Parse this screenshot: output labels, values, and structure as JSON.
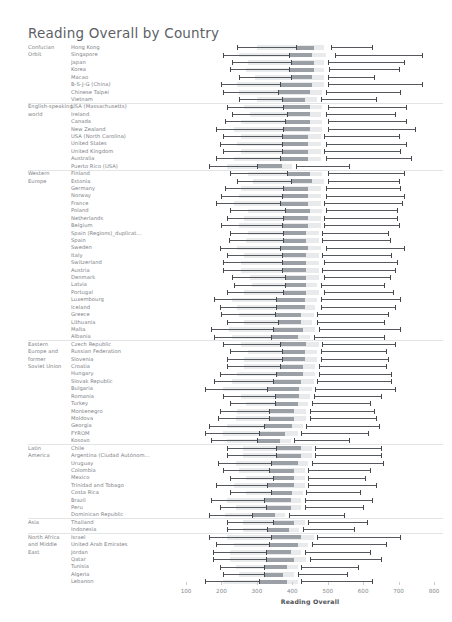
{
  "title": "Reading Overall by Country",
  "axis": {
    "label": "Reading Overall",
    "ticks": [
      100,
      200,
      300,
      400,
      500,
      600,
      700,
      800
    ],
    "min": 60,
    "max": 830
  },
  "chart_data": {
    "type": "bar",
    "title": "Reading Overall by Country",
    "xlabel": "Reading Overall",
    "ylabel": "",
    "xlim": [
      60,
      830
    ],
    "ticks": [
      100,
      200,
      300,
      400,
      500,
      600,
      700,
      800
    ],
    "grid": false,
    "legend": "none",
    "encoding": "Each row is a horizontal range (whisker low to high) with a light band and a darker central block marking the middle score range.",
    "groups": [
      {
        "group": "Confucian Orbit",
        "rows": [
          {
            "label": "Hong Kong",
            "low": 245,
            "band_start": 300,
            "dark_start": 410,
            "dark_end": 460,
            "band_end": 490,
            "mid": 510,
            "high": 625
          },
          {
            "label": "Singapore",
            "low": 205,
            "band_start": 250,
            "dark_start": 390,
            "dark_end": 455,
            "band_end": 495,
            "mid": 520,
            "high": 765
          },
          {
            "label": "Japan",
            "low": 230,
            "band_start": 275,
            "dark_start": 395,
            "dark_end": 460,
            "band_end": 490,
            "mid": 500,
            "high": 715
          },
          {
            "label": "Korea",
            "low": 225,
            "band_start": 270,
            "dark_start": 390,
            "dark_end": 460,
            "band_end": 490,
            "mid": 505,
            "high": 700
          },
          {
            "label": "Macao",
            "low": 250,
            "band_start": 295,
            "dark_start": 395,
            "dark_end": 455,
            "band_end": 490,
            "mid": 500,
            "high": 630
          },
          {
            "label": "B-S-J-G (China)",
            "low": 200,
            "band_start": 245,
            "dark_start": 365,
            "dark_end": 455,
            "band_end": 490,
            "mid": 500,
            "high": 765
          },
          {
            "label": "Chinese Taipei",
            "low": 205,
            "band_start": 250,
            "dark_start": 360,
            "dark_end": 450,
            "band_end": 485,
            "mid": 495,
            "high": 705
          },
          {
            "label": "Vietnam",
            "low": 250,
            "band_start": 300,
            "dark_start": 370,
            "dark_end": 435,
            "band_end": 470,
            "mid": 480,
            "high": 635
          }
        ]
      },
      {
        "group": "English-speaking world",
        "rows": [
          {
            "label": "USA (Massachusetts)",
            "low": 215,
            "band_start": 265,
            "dark_start": 375,
            "dark_end": 450,
            "band_end": 485,
            "mid": 500,
            "high": 720
          },
          {
            "label": "Ireland",
            "low": 230,
            "band_start": 280,
            "dark_start": 385,
            "dark_end": 450,
            "band_end": 480,
            "mid": 495,
            "high": 690
          },
          {
            "label": "Canada",
            "low": 210,
            "band_start": 255,
            "dark_start": 380,
            "dark_end": 450,
            "band_end": 485,
            "mid": 500,
            "high": 720
          },
          {
            "label": "New Zealand",
            "low": 185,
            "band_start": 235,
            "dark_start": 375,
            "dark_end": 450,
            "band_end": 485,
            "mid": 500,
            "high": 745
          },
          {
            "label": "USA (North Carolina)",
            "low": 205,
            "band_start": 255,
            "dark_start": 370,
            "dark_end": 445,
            "band_end": 480,
            "mid": 490,
            "high": 700
          },
          {
            "label": "United States",
            "low": 195,
            "band_start": 245,
            "dark_start": 370,
            "dark_end": 445,
            "band_end": 480,
            "mid": 495,
            "high": 720
          },
          {
            "label": "United Kingdom",
            "low": 205,
            "band_start": 255,
            "dark_start": 370,
            "dark_end": 445,
            "band_end": 480,
            "mid": 490,
            "high": 705
          },
          {
            "label": "Australia",
            "low": 185,
            "band_start": 235,
            "dark_start": 365,
            "dark_end": 445,
            "band_end": 480,
            "mid": 495,
            "high": 735
          },
          {
            "label": "Puerto Rico (USA)",
            "low": 165,
            "band_start": 215,
            "dark_start": 300,
            "dark_end": 370,
            "band_end": 400,
            "mid": 410,
            "high": 560
          }
        ]
      },
      {
        "group": "Western Europe",
        "rows": [
          {
            "label": "Finland",
            "low": 225,
            "band_start": 275,
            "dark_start": 385,
            "dark_end": 450,
            "band_end": 485,
            "mid": 500,
            "high": 715
          },
          {
            "label": "Estonia",
            "low": 245,
            "band_start": 290,
            "dark_start": 395,
            "dark_end": 455,
            "band_end": 490,
            "mid": 500,
            "high": 700
          },
          {
            "label": "Germany",
            "low": 210,
            "band_start": 255,
            "dark_start": 375,
            "dark_end": 445,
            "band_end": 480,
            "mid": 495,
            "high": 705
          },
          {
            "label": "Norway",
            "low": 200,
            "band_start": 250,
            "dark_start": 370,
            "dark_end": 445,
            "band_end": 480,
            "mid": 495,
            "high": 715
          },
          {
            "label": "France",
            "low": 185,
            "band_start": 235,
            "dark_start": 365,
            "dark_end": 445,
            "band_end": 480,
            "mid": 490,
            "high": 710
          },
          {
            "label": "Poland",
            "low": 225,
            "band_start": 275,
            "dark_start": 380,
            "dark_end": 450,
            "band_end": 485,
            "mid": 495,
            "high": 695
          },
          {
            "label": "Netherlands",
            "low": 215,
            "band_start": 265,
            "dark_start": 375,
            "dark_end": 445,
            "band_end": 480,
            "mid": 490,
            "high": 695
          },
          {
            "label": "Belgium",
            "low": 200,
            "band_start": 250,
            "dark_start": 370,
            "dark_end": 445,
            "band_end": 480,
            "mid": 490,
            "high": 700
          },
          {
            "label": "Spain (Regions)_duplicat...",
            "low": 225,
            "band_start": 275,
            "dark_start": 375,
            "dark_end": 440,
            "band_end": 475,
            "mid": 485,
            "high": 670
          },
          {
            "label": "Spain",
            "low": 220,
            "band_start": 270,
            "dark_start": 375,
            "dark_end": 440,
            "band_end": 475,
            "mid": 485,
            "high": 675
          },
          {
            "label": "Sweden",
            "low": 195,
            "band_start": 245,
            "dark_start": 365,
            "dark_end": 445,
            "band_end": 480,
            "mid": 495,
            "high": 715
          },
          {
            "label": "Italy",
            "low": 215,
            "band_start": 265,
            "dark_start": 370,
            "dark_end": 440,
            "band_end": 475,
            "mid": 485,
            "high": 680
          },
          {
            "label": "Switzerland",
            "low": 205,
            "band_start": 255,
            "dark_start": 370,
            "dark_end": 440,
            "band_end": 475,
            "mid": 490,
            "high": 695
          },
          {
            "label": "Austria",
            "low": 205,
            "band_start": 255,
            "dark_start": 370,
            "dark_end": 440,
            "band_end": 475,
            "mid": 485,
            "high": 690
          },
          {
            "label": "Denmark",
            "low": 230,
            "band_start": 280,
            "dark_start": 380,
            "dark_end": 440,
            "band_end": 475,
            "mid": 490,
            "high": 675
          },
          {
            "label": "Latvia",
            "low": 235,
            "band_start": 285,
            "dark_start": 380,
            "dark_end": 440,
            "band_end": 470,
            "mid": 480,
            "high": 660
          },
          {
            "label": "Portugal",
            "low": 215,
            "band_start": 265,
            "dark_start": 375,
            "dark_end": 440,
            "band_end": 475,
            "mid": 490,
            "high": 685
          },
          {
            "label": "Luxembourg",
            "low": 180,
            "band_start": 230,
            "dark_start": 355,
            "dark_end": 435,
            "band_end": 470,
            "mid": 480,
            "high": 705
          },
          {
            "label": "Iceland",
            "low": 195,
            "band_start": 245,
            "dark_start": 355,
            "dark_end": 435,
            "band_end": 465,
            "mid": 480,
            "high": 690
          },
          {
            "label": "Greece",
            "low": 200,
            "band_start": 250,
            "dark_start": 350,
            "dark_end": 425,
            "band_end": 460,
            "mid": 470,
            "high": 670
          },
          {
            "label": "Lithuania",
            "low": 215,
            "band_start": 265,
            "dark_start": 360,
            "dark_end": 425,
            "band_end": 455,
            "mid": 470,
            "high": 660
          },
          {
            "label": "Malta",
            "low": 170,
            "band_start": 220,
            "dark_start": 345,
            "dark_end": 430,
            "band_end": 465,
            "mid": 475,
            "high": 705
          },
          {
            "label": "Albania",
            "low": 180,
            "band_start": 230,
            "dark_start": 340,
            "dark_end": 415,
            "band_end": 450,
            "mid": 460,
            "high": 660
          }
        ]
      },
      {
        "group": "Eastern Europe and former Soviet Union",
        "rows": [
          {
            "label": "Czech Republic",
            "low": 205,
            "band_start": 255,
            "dark_start": 365,
            "dark_end": 440,
            "band_end": 475,
            "mid": 485,
            "high": 690
          },
          {
            "label": "Russian Federation",
            "low": 225,
            "band_start": 275,
            "dark_start": 370,
            "dark_end": 435,
            "band_end": 470,
            "mid": 480,
            "high": 665
          },
          {
            "label": "Slovenia",
            "low": 215,
            "band_start": 265,
            "dark_start": 370,
            "dark_end": 435,
            "band_end": 470,
            "mid": 480,
            "high": 670
          },
          {
            "label": "Croatia",
            "low": 215,
            "band_start": 265,
            "dark_start": 365,
            "dark_end": 430,
            "band_end": 465,
            "mid": 475,
            "high": 665
          },
          {
            "label": "Hungary",
            "low": 195,
            "band_start": 245,
            "dark_start": 355,
            "dark_end": 430,
            "band_end": 465,
            "mid": 475,
            "high": 680
          },
          {
            "label": "Slovak Republic",
            "low": 180,
            "band_start": 230,
            "dark_start": 345,
            "dark_end": 425,
            "band_end": 460,
            "mid": 470,
            "high": 680
          },
          {
            "label": "Bulgaria",
            "low": 155,
            "band_start": 205,
            "dark_start": 330,
            "dark_end": 420,
            "band_end": 455,
            "mid": 465,
            "high": 690
          },
          {
            "label": "Romania",
            "low": 205,
            "band_start": 255,
            "dark_start": 350,
            "dark_end": 420,
            "band_end": 450,
            "mid": 460,
            "high": 650
          },
          {
            "label": "Turkey",
            "low": 225,
            "band_start": 270,
            "dark_start": 350,
            "dark_end": 415,
            "band_end": 445,
            "mid": 455,
            "high": 620
          },
          {
            "label": "Montenegro",
            "low": 195,
            "band_start": 245,
            "dark_start": 335,
            "dark_end": 405,
            "band_end": 440,
            "mid": 450,
            "high": 630
          },
          {
            "label": "Moldova",
            "low": 190,
            "band_start": 240,
            "dark_start": 335,
            "dark_end": 405,
            "band_end": 440,
            "mid": 450,
            "high": 635
          },
          {
            "label": "Georgia",
            "low": 165,
            "band_start": 215,
            "dark_start": 320,
            "dark_end": 400,
            "band_end": 430,
            "mid": 440,
            "high": 645
          },
          {
            "label": "FYROM",
            "low": 155,
            "band_start": 205,
            "dark_start": 305,
            "dark_end": 380,
            "band_end": 415,
            "mid": 425,
            "high": 615
          },
          {
            "label": "Kosovo",
            "low": 170,
            "band_start": 215,
            "dark_start": 300,
            "dark_end": 365,
            "band_end": 395,
            "mid": 405,
            "high": 560
          }
        ]
      },
      {
        "group": "Latin America",
        "rows": [
          {
            "label": "Chile",
            "low": 215,
            "band_start": 260,
            "dark_start": 355,
            "dark_end": 425,
            "band_end": 455,
            "mid": 465,
            "high": 650
          },
          {
            "label": "Argentina (Ciudad Autónom...",
            "low": 215,
            "band_start": 260,
            "dark_start": 355,
            "dark_end": 425,
            "band_end": 455,
            "mid": 465,
            "high": 650
          },
          {
            "label": "Uruguay",
            "low": 190,
            "band_start": 240,
            "dark_start": 340,
            "dark_end": 415,
            "band_end": 445,
            "mid": 455,
            "high": 655
          },
          {
            "label": "Colombia",
            "low": 205,
            "band_start": 250,
            "dark_start": 335,
            "dark_end": 405,
            "band_end": 435,
            "mid": 445,
            "high": 620
          },
          {
            "label": "Mexico",
            "low": 225,
            "band_start": 270,
            "dark_start": 345,
            "dark_end": 405,
            "band_end": 435,
            "mid": 445,
            "high": 605
          },
          {
            "label": "Trinidad and Tobago",
            "low": 185,
            "band_start": 235,
            "dark_start": 330,
            "dark_end": 405,
            "band_end": 435,
            "mid": 445,
            "high": 635
          },
          {
            "label": "Costa Rica",
            "low": 225,
            "band_start": 270,
            "dark_start": 340,
            "dark_end": 400,
            "band_end": 430,
            "mid": 440,
            "high": 590
          },
          {
            "label": "Brazil",
            "low": 170,
            "band_start": 215,
            "dark_start": 320,
            "dark_end": 395,
            "band_end": 425,
            "mid": 435,
            "high": 625
          },
          {
            "label": "Peru",
            "low": 195,
            "band_start": 240,
            "dark_start": 325,
            "dark_end": 395,
            "band_end": 425,
            "mid": 435,
            "high": 600
          },
          {
            "label": "Dominican Republic",
            "low": 165,
            "band_start": 210,
            "dark_start": 285,
            "dark_end": 350,
            "band_end": 380,
            "mid": 390,
            "high": 545
          }
        ]
      },
      {
        "group": "Asia",
        "rows": [
          {
            "label": "Thailand",
            "low": 215,
            "band_start": 260,
            "dark_start": 345,
            "dark_end": 405,
            "band_end": 435,
            "mid": 445,
            "high": 610
          },
          {
            "label": "Indonesia",
            "low": 215,
            "band_start": 260,
            "dark_start": 330,
            "dark_end": 390,
            "band_end": 420,
            "mid": 430,
            "high": 575
          }
        ]
      },
      {
        "group": "North Africa and Middle East",
        "rows": [
          {
            "label": "Israel",
            "low": 165,
            "band_start": 215,
            "dark_start": 340,
            "dark_end": 425,
            "band_end": 460,
            "mid": 470,
            "high": 705
          },
          {
            "label": "United Arab Emirates",
            "low": 185,
            "band_start": 235,
            "dark_start": 335,
            "dark_end": 415,
            "band_end": 445,
            "mid": 455,
            "high": 665
          },
          {
            "label": "Jordan",
            "low": 175,
            "band_start": 225,
            "dark_start": 325,
            "dark_end": 395,
            "band_end": 425,
            "mid": 435,
            "high": 620
          },
          {
            "label": "Qatar",
            "low": 175,
            "band_start": 225,
            "dark_start": 325,
            "dark_end": 405,
            "band_end": 440,
            "mid": 450,
            "high": 650
          },
          {
            "label": "Tunisia",
            "low": 195,
            "band_start": 240,
            "dark_start": 320,
            "dark_end": 385,
            "band_end": 415,
            "mid": 425,
            "high": 585
          },
          {
            "label": "Algeria",
            "low": 205,
            "band_start": 250,
            "dark_start": 320,
            "dark_end": 375,
            "band_end": 405,
            "mid": 415,
            "high": 555
          },
          {
            "label": "Lebanon",
            "low": 155,
            "band_start": 205,
            "dark_start": 305,
            "dark_end": 385,
            "band_end": 415,
            "mid": 425,
            "high": 625
          }
        ]
      }
    ]
  }
}
